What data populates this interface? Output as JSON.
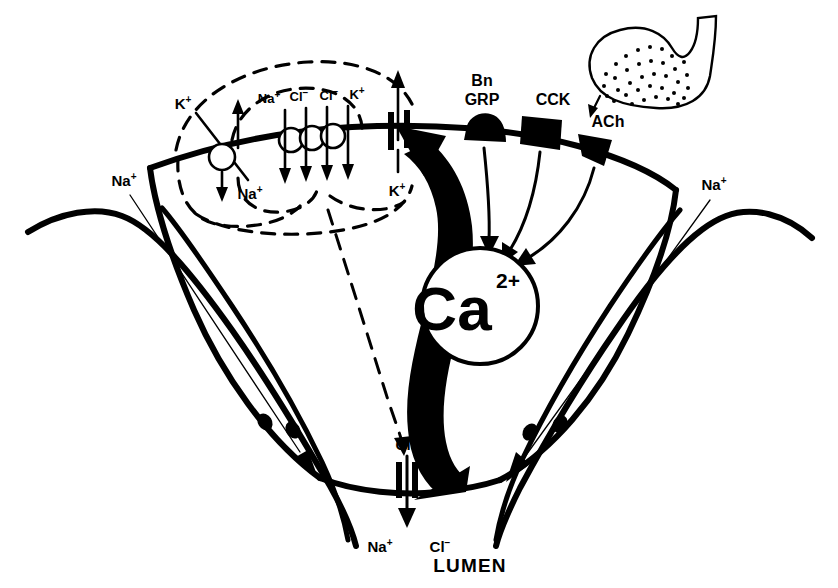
{
  "figure": {
    "lumen_label": "LUMEN",
    "colors": {
      "ink": "#000000",
      "background": "#ffffff"
    }
  },
  "basolateral": {
    "pump": {
      "name": "sodium-potassium-pump",
      "ion_out": "K",
      "ion_out_charge": "+",
      "ion_in": "Na",
      "ion_in_charge": "+"
    },
    "cotransporter": {
      "name": "na-k-2cl-cotransporter",
      "ions": [
        {
          "label": "Na",
          "charge": "+"
        },
        {
          "label": "Cl",
          "charge": "−"
        },
        {
          "label": "Cl",
          "charge": "−"
        },
        {
          "label": "K",
          "charge": "+"
        }
      ]
    },
    "potassium_channel": {
      "name": "potassium-channel",
      "label": "K",
      "charge": "+"
    }
  },
  "receptors": [
    {
      "id": "bn-grp",
      "line1": "Bn",
      "line2": "GRP",
      "shape": "dome"
    },
    {
      "id": "cck",
      "line1": "CCK",
      "line2": "",
      "shape": "rectangle"
    },
    {
      "id": "ach",
      "line1": "ACh",
      "line2": "",
      "shape": "trapezoid"
    }
  ],
  "nerve_terminal": {
    "name": "nerve-terminal-bouton",
    "transmitter": "ACh",
    "vesicles_visible": true
  },
  "second_messenger": {
    "name": "calcium",
    "symbol": "Ca",
    "charge": "2+"
  },
  "apical": {
    "chloride_channel": {
      "name": "chloride-channel",
      "label_above": "Cl",
      "charge_above": "−"
    },
    "secreted_ions": [
      {
        "label": "Na",
        "charge": "+"
      },
      {
        "label": "Cl",
        "charge": "−"
      }
    ]
  },
  "paracellular": {
    "left": {
      "label": "Na",
      "charge": "+"
    },
    "right": {
      "label": "Na",
      "charge": "+"
    }
  }
}
